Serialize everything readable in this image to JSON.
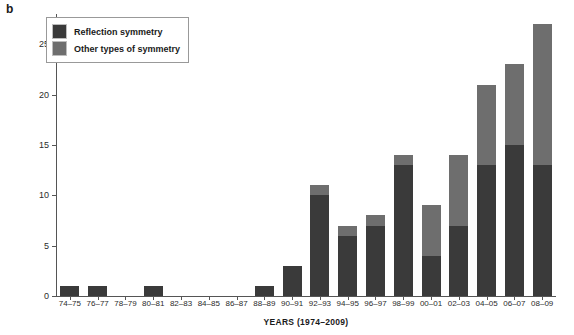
{
  "panel_label": "b",
  "legend": {
    "position": "top-left-inside",
    "items": [
      {
        "label": "Reflection symmetry",
        "color": "#3a3a3a",
        "swatch": "dark-gray-swatch"
      },
      {
        "label": "Other types of symmetry",
        "color": "#6e6e6e",
        "swatch": "medium-gray-swatch"
      }
    ]
  },
  "axes": {
    "ylabel": "NUMBER OF PUBLICATIONS",
    "xlabel": "YEARS (1974–2009)",
    "yticks": [
      "0",
      "5",
      "10",
      "15",
      "20",
      "25"
    ]
  },
  "chart_data": {
    "type": "bar",
    "title": "",
    "subtitle": "",
    "xlabel": "YEARS (1974–2009)",
    "ylabel": "NUMBER OF PUBLICATIONS",
    "ylim": [
      0,
      28
    ],
    "yticks": [
      0,
      5,
      10,
      15,
      20,
      25
    ],
    "grid": false,
    "stacked": true,
    "legend_position": "upper left",
    "categories": [
      "74–75",
      "76–77",
      "78–79",
      "80–81",
      "82–83",
      "84–85",
      "86–87",
      "88–89",
      "90–91",
      "92–93",
      "94–95",
      "96–97",
      "98–99",
      "00–01",
      "02–03",
      "04–05",
      "06–07",
      "08–09"
    ],
    "series": [
      {
        "name": "Reflection symmetry",
        "color": "#3a3a3a",
        "values": [
          1,
          1,
          0,
          1,
          0,
          0,
          0,
          1,
          3,
          10,
          6,
          7,
          13,
          4,
          7,
          13,
          15,
          13
        ]
      },
      {
        "name": "Other types of symmetry",
        "color": "#6e6e6e",
        "values": [
          0,
          0,
          0,
          0,
          0,
          0,
          0,
          0,
          0,
          1,
          1,
          1,
          1,
          5,
          7,
          8,
          8,
          14
        ]
      }
    ],
    "totals": [
      1,
      1,
      0,
      1,
      0,
      0,
      0,
      1,
      3,
      11,
      7,
      8,
      14,
      9,
      14,
      21,
      23,
      27
    ]
  }
}
